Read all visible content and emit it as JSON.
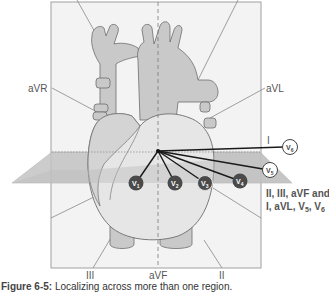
{
  "figure": {
    "caption_label": "Figure 6-5:",
    "caption_text": " Localizing across more than one region."
  },
  "leads": {
    "aVR": "aVR",
    "aVL": "aVL",
    "I": "I",
    "III": "III",
    "aVF": "aVF",
    "II": "II"
  },
  "precordial": [
    {
      "id": "V1",
      "base": "V",
      "sub": "1",
      "style": "filled"
    },
    {
      "id": "V2",
      "base": "V",
      "sub": "2",
      "style": "filled"
    },
    {
      "id": "V3",
      "base": "V",
      "sub": "3",
      "style": "filled"
    },
    {
      "id": "V4",
      "base": "V",
      "sub": "4",
      "style": "filled"
    },
    {
      "id": "V5",
      "base": "V",
      "sub": "5",
      "style": "outline"
    },
    {
      "id": "V6",
      "base": "V",
      "sub": "6",
      "style": "outline"
    }
  ],
  "annotation": {
    "line1": "II, III, aVF and",
    "line2_prefix": "I, aVL, V",
    "line2_sub1": "5",
    "line2_mid": ", V",
    "line2_sub2": "6"
  },
  "colors": {
    "frame_fill": "#f2f2f2",
    "frame_stroke": "#9a9a9a",
    "heart_fill": "#c9c9c9",
    "heart_light": "#ececec",
    "plane_fill": "#bdbdbd",
    "lead_line": "#1a1a1a",
    "electrode_fill": "#4a4a4a",
    "annotation_text": "#5a5a5a"
  }
}
